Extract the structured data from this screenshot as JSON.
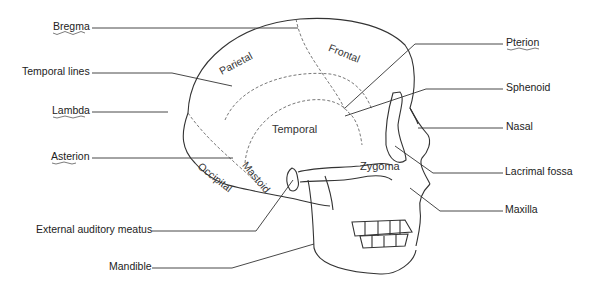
{
  "diagram": {
    "callout_labels_left": [
      {
        "text": "Bregma",
        "underlined": true
      },
      {
        "text": "Temporal lines",
        "underlined": false
      },
      {
        "text": "Lambda",
        "underlined": true
      },
      {
        "text": "Asterion",
        "underlined": true
      },
      {
        "text": "External auditory meatus",
        "underlined": false
      },
      {
        "text": "Mandible",
        "underlined": false
      }
    ],
    "callout_labels_right": [
      {
        "text": "Pterion",
        "underlined": true
      },
      {
        "text": "Sphenoid",
        "underlined": false
      },
      {
        "text": "Nasal",
        "underlined": false
      },
      {
        "text": "Lacrimal fossa",
        "underlined": false
      },
      {
        "text": "Maxilla",
        "underlined": false
      }
    ],
    "region_labels": {
      "parietal": "Parietal",
      "frontal": "Frontal",
      "temporal": "Temporal",
      "occipital": "Occipital",
      "mastoid": "Mastoid",
      "zygoma": "Zygoma"
    }
  }
}
